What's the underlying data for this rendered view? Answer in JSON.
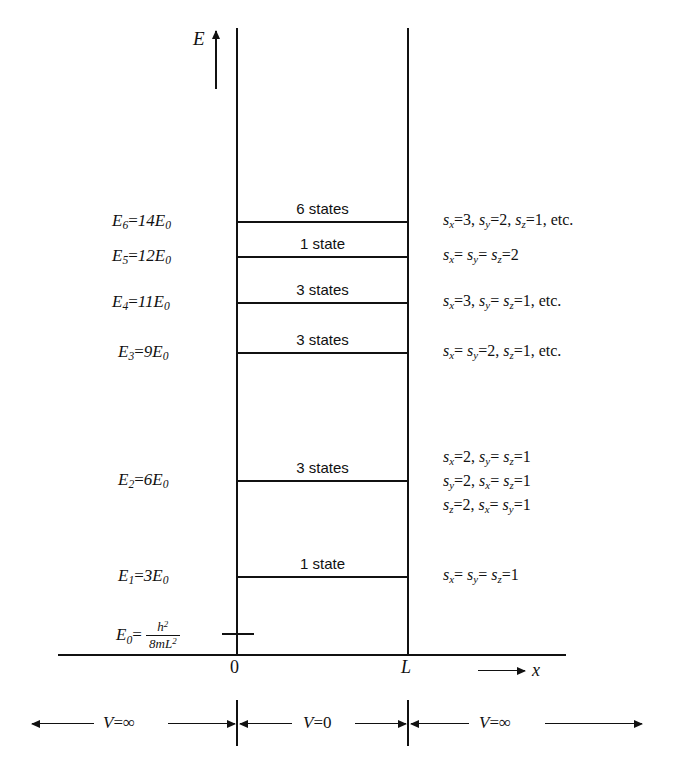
{
  "figure": {
    "type": "energy-level-diagram",
    "axes": {
      "vertical_label": "E",
      "horizontal_label": "x",
      "origin_tick": "0",
      "width_tick": "L"
    },
    "ground_energy": {
      "label": "E",
      "sub": "0",
      "equals": "=",
      "numerator": "h",
      "numerator_sup": "2",
      "denominator": "8mL",
      "denominator_sup": "2"
    },
    "levels": [
      {
        "name": "E6",
        "label_sym": "E",
        "label_sub": "6",
        "label_eq": "=",
        "label_val": "14E",
        "label_val_sub": "0",
        "degeneracy_text": "6 states",
        "degeneracy": 6,
        "energy_multiple": 14,
        "quantum_numbers": [
          {
            "sym": "s",
            "sub": "x",
            "eq": "=",
            "val": "3,"
          },
          {
            "sym": "s",
            "sub": "y",
            "eq": "=",
            "val": "2,"
          },
          {
            "sym": "s",
            "sub": "z",
            "eq": "=",
            "val": "1, etc."
          }
        ]
      },
      {
        "name": "E5",
        "label_sym": "E",
        "label_sub": "5",
        "label_eq": "=",
        "label_val": "12E",
        "label_val_sub": "0",
        "degeneracy_text": "1 state",
        "degeneracy": 1,
        "energy_multiple": 12,
        "quantum_numbers": [
          {
            "sym": "s",
            "sub": "x",
            "eq": "=",
            "val": ""
          },
          {
            "sym": "s",
            "sub": "y",
            "eq": "=",
            "val": ""
          },
          {
            "sym": "s",
            "sub": "z",
            "eq": "=",
            "val": "2"
          }
        ]
      },
      {
        "name": "E4",
        "label_sym": "E",
        "label_sub": "4",
        "label_eq": "=",
        "label_val": "11E",
        "label_val_sub": "0",
        "degeneracy_text": "3 states",
        "degeneracy": 3,
        "energy_multiple": 11,
        "quantum_numbers": [
          {
            "sym": "s",
            "sub": "x",
            "eq": "=",
            "val": "3,"
          },
          {
            "sym": "s",
            "sub": "y",
            "eq": "=",
            "val": ""
          },
          {
            "sym": "s",
            "sub": "z",
            "eq": "=",
            "val": "1, etc."
          }
        ]
      },
      {
        "name": "E3",
        "label_sym": "E",
        "label_sub": "3",
        "label_eq": "=",
        "label_val": "9E",
        "label_val_sub": "0",
        "degeneracy_text": "3 states",
        "degeneracy": 3,
        "energy_multiple": 9,
        "quantum_numbers": [
          {
            "sym": "s",
            "sub": "x",
            "eq": "=",
            "val": ""
          },
          {
            "sym": "s",
            "sub": "y",
            "eq": "=",
            "val": "2,"
          },
          {
            "sym": "s",
            "sub": "z",
            "eq": "=",
            "val": "1, etc."
          }
        ]
      },
      {
        "name": "E2",
        "label_sym": "E",
        "label_sub": "2",
        "label_eq": "=",
        "label_val": "6E",
        "label_val_sub": "0",
        "degeneracy_text": "3 states",
        "degeneracy": 3,
        "energy_multiple": 6,
        "quantum_numbers": []
      },
      {
        "name": "E1",
        "label_sym": "E",
        "label_sub": "1",
        "label_eq": "=",
        "label_val": "3E",
        "label_val_sub": "0",
        "degeneracy_text": "1 state",
        "degeneracy": 1,
        "energy_multiple": 3,
        "quantum_numbers": []
      }
    ],
    "level_labels": [
      "E₆ = 14E₀",
      "E₅ = 12E₀",
      "E₄ = 11E₀",
      "E₃ = 9E₀",
      "E₂ = 6E₀",
      "E₁ = 3E₀"
    ],
    "state_rows": [
      {
        "id": "row-e6",
        "text": "sₓ = 3, sᵧ = 2, s_z = 1, etc."
      },
      {
        "id": "row-e5",
        "text": "sₓ = sᵧ = s_z = 2"
      },
      {
        "id": "row-e4",
        "text": "sₓ = 3, sᵧ = s_z = 1, etc."
      },
      {
        "id": "row-e3",
        "text": "sₓ = sᵧ = 2, s_z = 1, etc."
      },
      {
        "id": "row-e2a",
        "text": "sₓ = 2, sᵧ = s_z = 1"
      },
      {
        "id": "row-e2b",
        "text": "sᵧ = 2, sₓ = s_z = 1"
      },
      {
        "id": "row-e2c",
        "text": "s_z = 2, sₓ = sᵧ = 1"
      },
      {
        "id": "row-e1",
        "text": "sₓ = sᵧ = s_z = 1"
      }
    ],
    "e2_states": [
      [
        {
          "sym": "s",
          "sub": "x",
          "eq": "=",
          "val": "2,"
        },
        {
          "sym": "s",
          "sub": "y",
          "eq": "=",
          "val": ""
        },
        {
          "sym": "s",
          "sub": "z",
          "eq": "=",
          "val": "1"
        }
      ],
      [
        {
          "sym": "s",
          "sub": "y",
          "eq": "=",
          "val": "2,"
        },
        {
          "sym": "s",
          "sub": "x",
          "eq": "=",
          "val": ""
        },
        {
          "sym": "s",
          "sub": "z",
          "eq": "=",
          "val": "1"
        }
      ],
      [
        {
          "sym": "s",
          "sub": "z",
          "eq": "=",
          "val": "2,"
        },
        {
          "sym": "s",
          "sub": "x",
          "eq": "=",
          "val": ""
        },
        {
          "sym": "s",
          "sub": "y",
          "eq": "=",
          "val": "1"
        }
      ]
    ],
    "e1_state": [
      {
        "sym": "s",
        "sub": "x",
        "eq": "=",
        "val": ""
      },
      {
        "sym": "s",
        "sub": "y",
        "eq": "=",
        "val": ""
      },
      {
        "sym": "s",
        "sub": "z",
        "eq": "=",
        "val": "1"
      }
    ],
    "potential_regions": [
      {
        "id": "left",
        "sym": "V",
        "eq": "=",
        "val": "∞",
        "text": "V = ∞"
      },
      {
        "id": "middle",
        "sym": "V",
        "eq": "=",
        "val": "0",
        "text": "V = 0"
      },
      {
        "id": "right",
        "sym": "V",
        "eq": "=",
        "val": "∞",
        "text": "V = ∞"
      }
    ],
    "colors": {
      "ink": "#111111",
      "background": "#ffffff"
    }
  }
}
